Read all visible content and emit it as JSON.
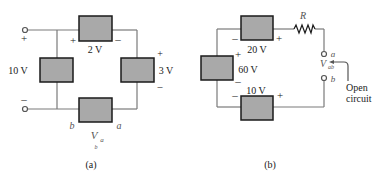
{
  "figure_a": {
    "caption": "(a)",
    "sources": {
      "top": {
        "label": "2 V",
        "plus": "+",
        "minus": "–"
      },
      "left": {
        "label": "10 V"
      },
      "right": {
        "label": "3 V",
        "plus": "+",
        "minus": "–"
      },
      "bottom": {
        "label": ""
      }
    },
    "terminals": {
      "top_sign": "+",
      "bottom_sign": "–"
    },
    "nodes": {
      "b": "b",
      "a": "a"
    },
    "voltage_label": {
      "main": "V",
      "sub_a": "a",
      "sub_b": "b"
    }
  },
  "figure_b": {
    "caption": "(b)",
    "sources": {
      "top": {
        "label": "20 V",
        "minus": "–",
        "plus": "+"
      },
      "left": {
        "label": "60 V",
        "plus": "+",
        "minus": "–"
      },
      "bottom": {
        "label": "10 V",
        "minus": "–",
        "plus": "+"
      }
    },
    "resistor": {
      "label": "R"
    },
    "terminals": {
      "a": "a",
      "b": "b"
    },
    "voltage_label": {
      "main": "V",
      "sub": "ab"
    },
    "annotation": {
      "line1": "Open",
      "line2": "circuit"
    }
  },
  "colors": {
    "box_fill": "#a9a9a9",
    "box_stroke": "#1a1a1a",
    "wire": "#7a7a7a"
  }
}
